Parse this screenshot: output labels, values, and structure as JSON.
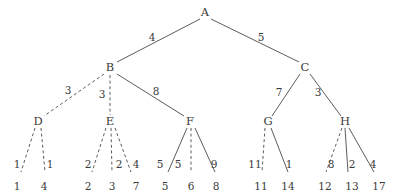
{
  "figure": {
    "name": "weighted-tree-diagram",
    "width": 393,
    "height": 194,
    "background": "#ffffff",
    "stroke_color": "#4a4a4a",
    "text_color": "#3a3a3a"
  },
  "nodes": [
    {
      "id": "A",
      "label": "A",
      "x": 205,
      "y": 13,
      "kind": "root"
    },
    {
      "id": "B",
      "label": "B",
      "x": 110,
      "y": 68,
      "kind": "internal"
    },
    {
      "id": "C",
      "label": "C",
      "x": 305,
      "y": 68,
      "kind": "internal"
    },
    {
      "id": "D",
      "label": "D",
      "x": 38,
      "y": 122,
      "kind": "internal"
    },
    {
      "id": "E",
      "label": "E",
      "x": 110,
      "y": 122,
      "kind": "internal"
    },
    {
      "id": "F",
      "label": "F",
      "x": 190,
      "y": 122,
      "kind": "internal"
    },
    {
      "id": "G",
      "label": "G",
      "x": 268,
      "y": 122,
      "kind": "internal"
    },
    {
      "id": "H",
      "label": "H",
      "x": 345,
      "y": 122,
      "kind": "internal"
    }
  ],
  "leaves": [
    {
      "id": "L1",
      "label": "1",
      "x": 17,
      "y": 186,
      "parent": "D"
    },
    {
      "id": "L2",
      "label": "4",
      "x": 44,
      "y": 186,
      "parent": "D"
    },
    {
      "id": "L3",
      "label": "2",
      "x": 88,
      "y": 186,
      "parent": "E"
    },
    {
      "id": "L4",
      "label": "3",
      "x": 112,
      "y": 186,
      "parent": "E"
    },
    {
      "id": "L5",
      "label": "7",
      "x": 136,
      "y": 186,
      "parent": "E"
    },
    {
      "id": "L6",
      "label": "5",
      "x": 165,
      "y": 186,
      "parent": "F"
    },
    {
      "id": "L7",
      "label": "6",
      "x": 191,
      "y": 186,
      "parent": "F"
    },
    {
      "id": "L8",
      "label": "8",
      "x": 216,
      "y": 186,
      "parent": "F"
    },
    {
      "id": "L9",
      "label": "11",
      "x": 261,
      "y": 186,
      "parent": "G"
    },
    {
      "id": "L10",
      "label": "14",
      "x": 288,
      "y": 186,
      "parent": "G"
    },
    {
      "id": "L11",
      "label": "12",
      "x": 325,
      "y": 186,
      "parent": "H"
    },
    {
      "id": "L12",
      "label": "13",
      "x": 352,
      "y": 186,
      "parent": "H"
    },
    {
      "id": "L13",
      "label": "17",
      "x": 379,
      "y": 186,
      "parent": "H"
    }
  ],
  "edges": [
    {
      "id": "A-B",
      "from": "A",
      "to": "B",
      "weight": "4",
      "style": "solid",
      "x1": 200,
      "y1": 19,
      "x2": 117,
      "y2": 62,
      "wx": 152,
      "wy": 37
    },
    {
      "id": "A-C",
      "from": "A",
      "to": "C",
      "weight": "5",
      "style": "solid",
      "x1": 211,
      "y1": 19,
      "x2": 299,
      "y2": 62,
      "wx": 261,
      "wy": 37
    },
    {
      "id": "B-D",
      "from": "B",
      "to": "D",
      "weight": "3",
      "style": "dashed",
      "x1": 104,
      "y1": 74,
      "x2": 44,
      "y2": 116,
      "wx": 68,
      "wy": 90
    },
    {
      "id": "B-E",
      "from": "B",
      "to": "E",
      "weight": "3",
      "style": "dashed",
      "x1": 110,
      "y1": 75,
      "x2": 110,
      "y2": 115,
      "wx": 102,
      "wy": 94
    },
    {
      "id": "B-F",
      "from": "B",
      "to": "F",
      "weight": "8",
      "style": "solid",
      "x1": 117,
      "y1": 74,
      "x2": 184,
      "y2": 116,
      "wx": 156,
      "wy": 91
    },
    {
      "id": "C-G",
      "from": "C",
      "to": "G",
      "weight": "7",
      "style": "solid",
      "x1": 300,
      "y1": 74,
      "x2": 272,
      "y2": 116,
      "wx": 279,
      "wy": 92
    },
    {
      "id": "C-H",
      "from": "C",
      "to": "H",
      "weight": "3",
      "style": "solid",
      "x1": 310,
      "y1": 74,
      "x2": 341,
      "y2": 116,
      "wx": 318,
      "wy": 92
    },
    {
      "id": "D-L1",
      "from": "D",
      "to": "L1",
      "weight": "1",
      "style": "dashed",
      "x1": 35,
      "y1": 128,
      "x2": 21,
      "y2": 172,
      "wx": 17,
      "wy": 164
    },
    {
      "id": "D-L2",
      "from": "D",
      "to": "L2",
      "weight": "1",
      "style": "dashed",
      "x1": 41,
      "y1": 128,
      "x2": 45,
      "y2": 172,
      "wx": 50,
      "wy": 164
    },
    {
      "id": "E-L3",
      "from": "E",
      "to": "L3",
      "weight": "2",
      "style": "dashed",
      "x1": 106,
      "y1": 128,
      "x2": 92,
      "y2": 172,
      "wx": 88,
      "wy": 164
    },
    {
      "id": "E-L4",
      "from": "E",
      "to": "L4",
      "weight": "2",
      "style": "dashed",
      "x1": 111,
      "y1": 128,
      "x2": 112,
      "y2": 172,
      "wx": 119,
      "wy": 164
    },
    {
      "id": "E-L5",
      "from": "E",
      "to": "L5",
      "weight": "4",
      "style": "dashed",
      "x1": 115,
      "y1": 128,
      "x2": 131,
      "y2": 172,
      "wx": 136,
      "wy": 164
    },
    {
      "id": "F-L6",
      "from": "F",
      "to": "L6",
      "weight": "5",
      "style": "solid",
      "x1": 187,
      "y1": 128,
      "x2": 168,
      "y2": 172,
      "wx": 160,
      "wy": 164
    },
    {
      "id": "F-L7",
      "from": "F",
      "to": "L7",
      "weight": "5",
      "style": "dashed",
      "x1": 191,
      "y1": 128,
      "x2": 191,
      "y2": 172,
      "wx": 178,
      "wy": 164
    },
    {
      "id": "F-L8",
      "from": "F",
      "to": "L8",
      "weight": "9",
      "style": "solid",
      "x1": 195,
      "y1": 128,
      "x2": 215,
      "y2": 172,
      "wx": 214,
      "wy": 164
    },
    {
      "id": "G-L9",
      "from": "G",
      "to": "L9",
      "weight": "11",
      "style": "dashed",
      "x1": 265,
      "y1": 128,
      "x2": 262,
      "y2": 172,
      "wx": 255,
      "wy": 164
    },
    {
      "id": "G-L10",
      "from": "G",
      "to": "L10",
      "weight": "1",
      "style": "solid",
      "x1": 271,
      "y1": 128,
      "x2": 288,
      "y2": 172,
      "wx": 289,
      "wy": 164
    },
    {
      "id": "H-L11",
      "from": "H",
      "to": "L11",
      "weight": "8",
      "style": "dashed",
      "x1": 342,
      "y1": 128,
      "x2": 326,
      "y2": 172,
      "wx": 331,
      "wy": 164
    },
    {
      "id": "H-L12",
      "from": "H",
      "to": "L12",
      "weight": "2",
      "style": "solid",
      "x1": 345,
      "y1": 128,
      "x2": 348,
      "y2": 172,
      "wx": 352,
      "wy": 164
    },
    {
      "id": "H-L13",
      "from": "H",
      "to": "L13",
      "weight": "4",
      "style": "solid",
      "x1": 349,
      "y1": 128,
      "x2": 374,
      "y2": 172,
      "wx": 373,
      "wy": 164
    }
  ]
}
